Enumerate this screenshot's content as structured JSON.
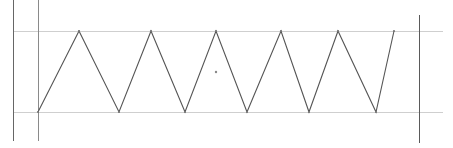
{
  "diagram": {
    "type": "triangle-wave",
    "canvas": {
      "width": 453,
      "height": 148,
      "background": "#ffffff"
    },
    "colors": {
      "wave": "#555555",
      "guide_horizontal": "#cfcfcf",
      "guide_vertical_left_outer": "#666666",
      "guide_vertical_left_inner": "#8a8a8a",
      "guide_vertical_right": "#5a5a5a",
      "center_marker": "#888888"
    },
    "guides": {
      "top_y": 31,
      "bottom_y": 112,
      "horizontal_x_start": 13,
      "horizontal_x_end": 443,
      "left_outer_x": 13,
      "left_inner_x": 38,
      "right_x": 419
    },
    "wave_points": [
      [
        38,
        112
      ],
      [
        79,
        31
      ],
      [
        119,
        112
      ],
      [
        151,
        31
      ],
      [
        185,
        112
      ],
      [
        216,
        31
      ],
      [
        247,
        112
      ],
      [
        281,
        31
      ],
      [
        309,
        112
      ],
      [
        338,
        31
      ],
      [
        376,
        112
      ],
      [
        394,
        31
      ]
    ],
    "center_marker": {
      "x": 216,
      "y": 72,
      "r": 1.2
    },
    "clipped_caption": ""
  }
}
